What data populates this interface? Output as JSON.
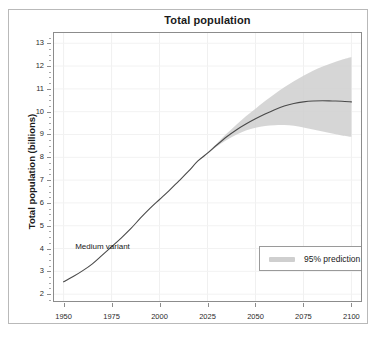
{
  "chart_data": {
    "type": "line",
    "title": "Total population",
    "xlabel": "",
    "ylabel": "Total population (billions)",
    "xlim": [
      1945,
      2105
    ],
    "ylim": [
      1.7,
      13.45
    ],
    "xticks": [
      1950,
      1975,
      2000,
      2025,
      2050,
      2075,
      2100
    ],
    "xticklabels": [
      "1950",
      "1975",
      "2000",
      "2025",
      "2050",
      "2075",
      "2100"
    ],
    "yticks": [
      2,
      3,
      4,
      5,
      6,
      7,
      8,
      9,
      10,
      11,
      12,
      13
    ],
    "yticklabels": [
      "2",
      "3",
      "4",
      "5",
      "6",
      "7",
      "8",
      "9",
      "10",
      "11",
      "12",
      "13"
    ],
    "grid": true,
    "legend_position": "center-right",
    "annotations": [
      {
        "text": "Medium variant",
        "x": 1968,
        "y": 4.05
      }
    ],
    "legend": [
      {
        "label": "95% prediction interval",
        "color": "#cfcfcf",
        "marker": "band"
      }
    ],
    "series": [
      {
        "name": "Medium variant",
        "color": "#4a4a4a",
        "x": [
          1950,
          1955,
          1960,
          1965,
          1970,
          1975,
          1980,
          1985,
          1990,
          1995,
          2000,
          2005,
          2010,
          2015,
          2020,
          2025,
          2030,
          2035,
          2040,
          2045,
          2050,
          2055,
          2060,
          2065,
          2070,
          2075,
          2080,
          2085,
          2090,
          2095,
          2100
        ],
        "values": [
          2.54,
          2.77,
          3.03,
          3.33,
          3.7,
          4.08,
          4.46,
          4.87,
          5.33,
          5.76,
          6.15,
          6.54,
          6.96,
          7.38,
          7.84,
          8.18,
          8.55,
          8.9,
          9.2,
          9.46,
          9.69,
          9.9,
          10.09,
          10.25,
          10.36,
          10.43,
          10.47,
          10.48,
          10.47,
          10.46,
          10.43
        ]
      }
    ],
    "interval_band": {
      "name": "95% prediction interval",
      "color": "#cfcfcf",
      "x": [
        2022,
        2025,
        2030,
        2035,
        2040,
        2045,
        2050,
        2055,
        2060,
        2065,
        2070,
        2075,
        2080,
        2085,
        2090,
        2095,
        2100
      ],
      "lower": [
        7.96,
        8.15,
        8.48,
        8.76,
        8.99,
        9.17,
        9.3,
        9.37,
        9.41,
        9.42,
        9.38,
        9.31,
        9.22,
        9.13,
        9.04,
        8.96,
        8.9
      ],
      "upper": [
        8.0,
        8.22,
        8.62,
        9.04,
        9.43,
        9.8,
        10.13,
        10.47,
        10.78,
        11.07,
        11.33,
        11.58,
        11.8,
        11.98,
        12.14,
        12.28,
        12.4
      ]
    }
  },
  "legend": {
    "interval_label": "95% prediction interval"
  },
  "annotations": {
    "medium_variant": "Medium variant"
  }
}
